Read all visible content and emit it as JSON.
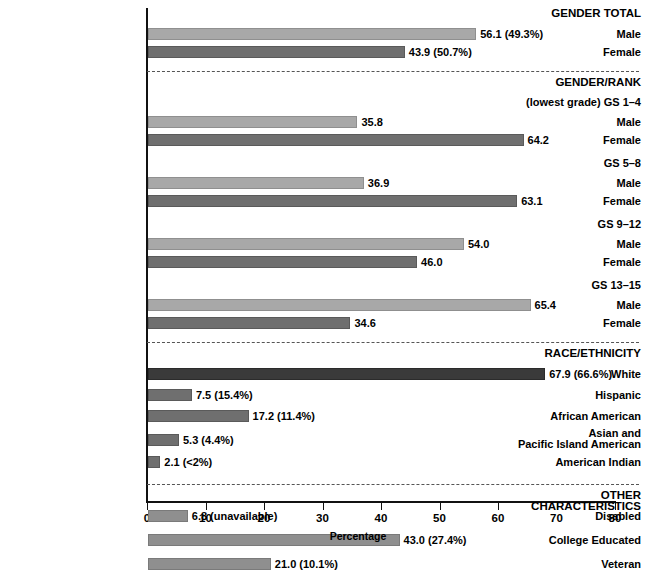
{
  "chart_data": {
    "type": "bar",
    "title": "",
    "xlabel": "Percentage",
    "ylabel": "",
    "xlim": [
      0,
      80
    ],
    "xticks": [
      0,
      10,
      20,
      30,
      40,
      50,
      60,
      70,
      80
    ],
    "orientation": "horizontal",
    "grid": false,
    "legend": null,
    "sections": [
      {
        "heading": "GENDER TOTAL",
        "rows": [
          {
            "label": "Male",
            "value": 56.1,
            "value_label": "56.1 (49.3%)",
            "style": "male"
          },
          {
            "label": "Female",
            "value": 43.9,
            "value_label": "43.9 (50.7%)",
            "style": "female"
          }
        ]
      },
      {
        "heading": "GENDER/RANK",
        "subgroups": [
          {
            "group_label": "(lowest grade) GS 1–4",
            "rows": [
              {
                "label": "Male",
                "value": 35.8,
                "value_label": "35.8",
                "style": "male"
              },
              {
                "label": "Female",
                "value": 64.2,
                "value_label": "64.2",
                "style": "female"
              }
            ]
          },
          {
            "group_label": "GS 5–8",
            "rows": [
              {
                "label": "Male",
                "value": 36.9,
                "value_label": "36.9",
                "style": "male"
              },
              {
                "label": "Female",
                "value": 63.1,
                "value_label": "63.1",
                "style": "female"
              }
            ]
          },
          {
            "group_label": "GS 9–12",
            "rows": [
              {
                "label": "Male",
                "value": 54.0,
                "value_label": "54.0",
                "style": "male"
              },
              {
                "label": "Female",
                "value": 46.0,
                "value_label": "46.0",
                "style": "female"
              }
            ]
          },
          {
            "group_label": "GS 13–15",
            "rows": [
              {
                "label": "Male",
                "value": 65.4,
                "value_label": "65.4",
                "style": "male"
              },
              {
                "label": "Female",
                "value": 34.6,
                "value_label": "34.6",
                "style": "female"
              }
            ]
          }
        ]
      },
      {
        "heading": "RACE/ETHNICITY",
        "rows": [
          {
            "label": "White",
            "value": 67.9,
            "value_label": "67.9 (66.6%)",
            "style": "dark"
          },
          {
            "label": "Hispanic",
            "value": 7.5,
            "value_label": "7.5 (15.4%)",
            "style": "mid"
          },
          {
            "label": "African American",
            "value": 17.2,
            "value_label": "17.2 (11.4%)",
            "style": "mid"
          },
          {
            "label": "Asian and\nPacific Island American",
            "value": 5.3,
            "value_label": "5.3 (4.4%)",
            "style": "mid"
          },
          {
            "label": "American Indian",
            "value": 2.1,
            "value_label": "2.1 (<2%)",
            "style": "mid"
          }
        ]
      },
      {
        "heading": "OTHER CHARACTERISTICS",
        "rows": [
          {
            "label": "Disabled",
            "value": 6.8,
            "value_label": "6.8 (unavailable)",
            "style": "light"
          },
          {
            "label": "College Educated",
            "value": 43.0,
            "value_label": "43.0 (27.4%)",
            "style": "light"
          },
          {
            "label": "Veteran",
            "value": 21.0,
            "value_label": "21.0 (10.1%)",
            "style": "light"
          }
        ]
      }
    ]
  },
  "colors": {
    "male_bar": "#a8a8a8",
    "female_bar": "#6f6f6f",
    "dark_bar": "#3a3a3a",
    "mid_bar": "#6f6f6f",
    "light_bar": "#8f8f8f",
    "axis": "#111111",
    "separator": "#555555",
    "text": "#000000",
    "background": "#ffffff"
  }
}
